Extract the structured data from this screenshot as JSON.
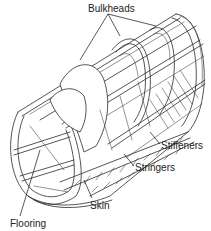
{
  "figure": {
    "background": "#ffffff",
    "line_color": "#2a2a2a",
    "labels": [
      {
        "id": "bulkheads",
        "text": "Bulkheads",
        "x": 88,
        "y": 3
      },
      {
        "id": "stiffeners",
        "text": "Stiffeners",
        "x": 161,
        "y": 140
      },
      {
        "id": "stringers",
        "text": "Stringers",
        "x": 135,
        "y": 162
      },
      {
        "id": "skin",
        "text": "Skin",
        "x": 90,
        "y": 200
      },
      {
        "id": "flooring",
        "text": "Flooring",
        "x": 10,
        "y": 218
      }
    ]
  }
}
